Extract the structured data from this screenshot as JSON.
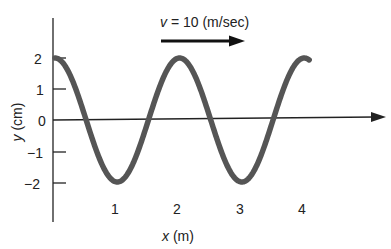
{
  "diagram": {
    "type": "traveling-wave",
    "velocity_label": "v = 10 (m/sec)",
    "velocity_var": "v",
    "velocity_rest": " = 10 (m/sec)",
    "x_axis_label": "x (m)",
    "x_axis_var": "x",
    "x_axis_unit": " (m)",
    "y_axis_label": "y (cm)",
    "y_axis_var": "y",
    "y_axis_unit": " (cm)",
    "x_ticks": [
      "1",
      "2",
      "3",
      "4"
    ],
    "y_ticks": [
      "2",
      "1",
      "0",
      "−1",
      "−2"
    ],
    "amplitude_cm": 2,
    "wavelength_m": 2,
    "x_range": [
      0,
      4.2
    ],
    "curve_color": "#555555",
    "axis_color": "#222222"
  }
}
